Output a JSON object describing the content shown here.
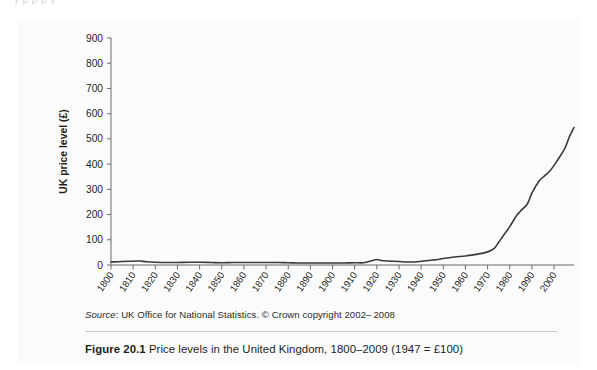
{
  "page": {
    "top_cut_text": "y   p   p                                    p                                    y"
  },
  "figure_badge": {
    "label": "FIGURE",
    "number": "20.1",
    "gradient_from": "#9f9f9f",
    "gradient_to": "#e6e6e6"
  },
  "source": {
    "prefix": "Source",
    "separator": ": ",
    "text": "UK Office for National Statistics. © Crown copyright 2002– 2008"
  },
  "caption": {
    "strong": "Figure 20.1",
    "text": "  Price levels in the United Kingdom, 1800–2009 (1947 = £100)"
  },
  "chart_data": {
    "type": "line",
    "title": "",
    "xlabel": "",
    "ylabel": "UK price level (£)",
    "xlim": [
      1800,
      2009
    ],
    "ylim": [
      0,
      900
    ],
    "ytick_step": 100,
    "yticks": [
      0,
      100,
      200,
      300,
      400,
      500,
      600,
      700,
      800,
      900
    ],
    "xticks": [
      1800,
      1810,
      1820,
      1830,
      1840,
      1850,
      1860,
      1870,
      1880,
      1890,
      1900,
      1910,
      1920,
      1930,
      1940,
      1950,
      1960,
      1970,
      1980,
      1990,
      2000
    ],
    "xtick_labels": [
      "1800",
      "1810",
      "1820",
      "1830",
      "1840",
      "1850",
      "1860",
      "1870",
      "1880",
      "1890",
      "1900",
      "1910",
      "1920",
      "1930",
      "1940",
      "1950",
      "1960",
      "1970",
      "1980",
      "1990",
      "2000"
    ],
    "xtick_label_rotation": -55,
    "grid": false,
    "legend": null,
    "line_color": "#3a3a3a",
    "line_width": 1.6,
    "plot_background": "#fbfbfb",
    "axis_color": "#6b6b6b",
    "series": [
      {
        "name": "UK price level",
        "x": [
          1800,
          1805,
          1810,
          1813,
          1816,
          1820,
          1825,
          1830,
          1835,
          1840,
          1845,
          1850,
          1855,
          1860,
          1865,
          1870,
          1875,
          1880,
          1885,
          1890,
          1895,
          1900,
          1905,
          1910,
          1914,
          1918,
          1920,
          1922,
          1925,
          1930,
          1933,
          1935,
          1938,
          1940,
          1945,
          1947,
          1950,
          1955,
          1960,
          1965,
          1970,
          1973,
          1975,
          1977,
          1980,
          1983,
          1985,
          1988,
          1990,
          1993,
          1995,
          1998,
          2000,
          2003,
          2005,
          2007,
          2009
        ],
        "y": [
          12,
          14,
          15,
          16,
          13,
          11,
          10,
          10,
          11,
          11,
          10,
          9,
          10,
          10,
          10,
          10,
          10,
          9,
          8,
          8,
          8,
          8,
          8,
          9,
          9,
          18,
          22,
          18,
          16,
          14,
          12,
          12,
          13,
          15,
          20,
          21,
          26,
          32,
          36,
          42,
          52,
          66,
          90,
          115,
          152,
          195,
          215,
          243,
          285,
          330,
          348,
          372,
          395,
          435,
          465,
          510,
          545
        ]
      }
    ],
    "series_display_note": "Values are index numbers, 1947 = £100, rescaled to the plotted £ price level."
  }
}
